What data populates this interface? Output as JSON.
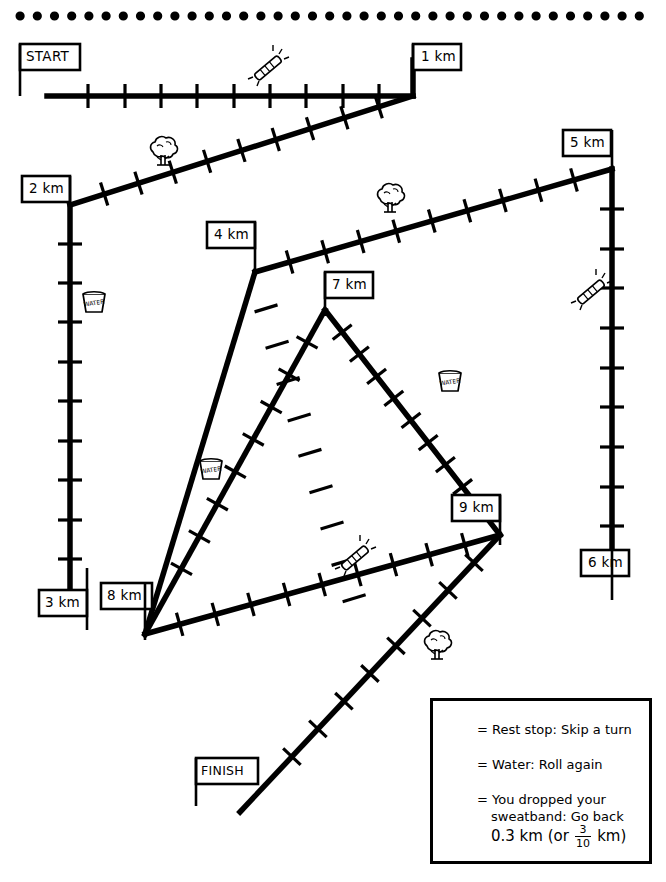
{
  "track": {
    "markers": [
      {
        "id": "start",
        "label": "START"
      },
      {
        "id": "km1",
        "label": "1 km"
      },
      {
        "id": "km2",
        "label": "2 km"
      },
      {
        "id": "km3",
        "label": "3 km"
      },
      {
        "id": "km4",
        "label": "4 km"
      },
      {
        "id": "km5",
        "label": "5 km"
      },
      {
        "id": "km6",
        "label": "6 km"
      },
      {
        "id": "km7",
        "label": "7 km"
      },
      {
        "id": "km8",
        "label": "8 km"
      },
      {
        "id": "km9",
        "label": "9 km"
      },
      {
        "id": "finish",
        "label": "FINISH"
      }
    ],
    "icons": [
      {
        "name": "sweatband-icon",
        "x": 268,
        "y": 68
      },
      {
        "name": "tree-icon",
        "x": 163,
        "y": 158
      },
      {
        "name": "tree-icon",
        "x": 390,
        "y": 205
      },
      {
        "name": "sweatband-icon",
        "x": 591,
        "y": 292
      },
      {
        "name": "water-cup-icon",
        "x": 94,
        "y": 303
      },
      {
        "name": "water-cup-icon",
        "x": 450,
        "y": 382
      },
      {
        "name": "water-cup-icon",
        "x": 211,
        "y": 470
      },
      {
        "name": "sweatband-icon",
        "x": 355,
        "y": 558
      },
      {
        "name": "tree-icon",
        "x": 437,
        "y": 652
      }
    ]
  },
  "legend": {
    "rows": [
      {
        "icon": "tree-icon",
        "equals": "=",
        "text": "Rest stop: Skip a turn"
      },
      {
        "icon": "water-cup-icon",
        "equals": "=",
        "text": "Water: Roll again"
      },
      {
        "icon": "sweatband-icon",
        "equals": "=",
        "text_line1": "You dropped your",
        "text_line2": "sweatband: Go back",
        "text_line3_pre": "0.3 km (or",
        "fraction_numerator": "3",
        "fraction_denominator": "10",
        "text_line3_post": "km)"
      }
    ]
  },
  "colors": {
    "ink": "#000000",
    "paper": "#ffffff"
  }
}
